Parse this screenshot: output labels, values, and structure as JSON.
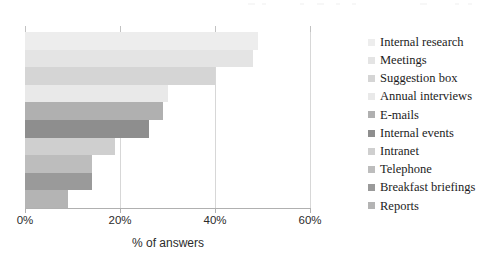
{
  "chart_data": {
    "type": "bar",
    "orientation": "horizontal",
    "title": "",
    "xlabel": "% of answers",
    "ylabel": "",
    "xlim": [
      0,
      60
    ],
    "xticks": [
      "0%",
      "20%",
      "40%",
      "60%"
    ],
    "xtick_values": [
      0,
      20,
      40,
      60
    ],
    "grid": true,
    "legend_position": "right",
    "categories": [
      "Internal research",
      "Meetings",
      "Suggestion box",
      "Annual interviews",
      "E-mails",
      "Internal events",
      "Intranet",
      "Telephone",
      "Breakfast briefings",
      "Reports"
    ],
    "values": [
      49,
      48,
      40,
      30,
      29,
      26,
      19,
      14,
      14,
      9
    ],
    "colors": [
      "#ededed",
      "#e4e4e4",
      "#d5d5d5",
      "#e9e9e9",
      "#b0b0b0",
      "#8e8e8e",
      "#cfcfcf",
      "#bdbdbd",
      "#9a9a9a",
      "#b4b4b4"
    ]
  },
  "axis": {
    "x_title": "% of answers"
  }
}
